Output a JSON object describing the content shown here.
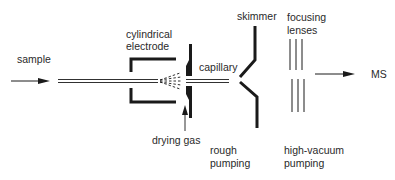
{
  "diagram": {
    "labels": {
      "sample": "sample",
      "cylindrical_electrode_1": "cylindrical",
      "cylindrical_electrode_2": "electrode",
      "capillary": "capillary",
      "skimmer": "skimmer",
      "focusing_lenses_1": "focusing",
      "focusing_lenses_2": "lenses",
      "ms": "MS",
      "drying_gas": "drying gas",
      "rough_pumping_1": "rough",
      "rough_pumping_2": "pumping",
      "high_vacuum_pumping_1": "high-vacuum",
      "high_vacuum_pumping_2": "pumping"
    },
    "colors": {
      "ink": "#1a1a1a",
      "background": "#ffffff"
    }
  }
}
